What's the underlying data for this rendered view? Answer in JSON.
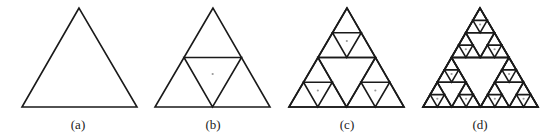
{
  "figure": {
    "panels": [
      {
        "label": "(a)",
        "iteration": 0,
        "apex": [
          79,
          8
        ],
        "base_left": [
          22,
          107
        ],
        "base_right": [
          137,
          107
        ]
      },
      {
        "label": "(b)",
        "iteration": 1,
        "apex": [
          213,
          8
        ],
        "base_left": [
          155,
          107
        ],
        "base_right": [
          270,
          107
        ]
      },
      {
        "label": "(c)",
        "iteration": 2,
        "apex": [
          347,
          8
        ],
        "base_left": [
          289,
          107
        ],
        "base_right": [
          404,
          107
        ]
      },
      {
        "label": "(d)",
        "iteration": 3,
        "apex": [
          480,
          8
        ],
        "base_left": [
          423,
          107
        ],
        "base_right": [
          538,
          107
        ]
      }
    ],
    "colors": {
      "stroke": "#1a1a1a",
      "dot": "#999999",
      "background": "#ffffff"
    }
  }
}
